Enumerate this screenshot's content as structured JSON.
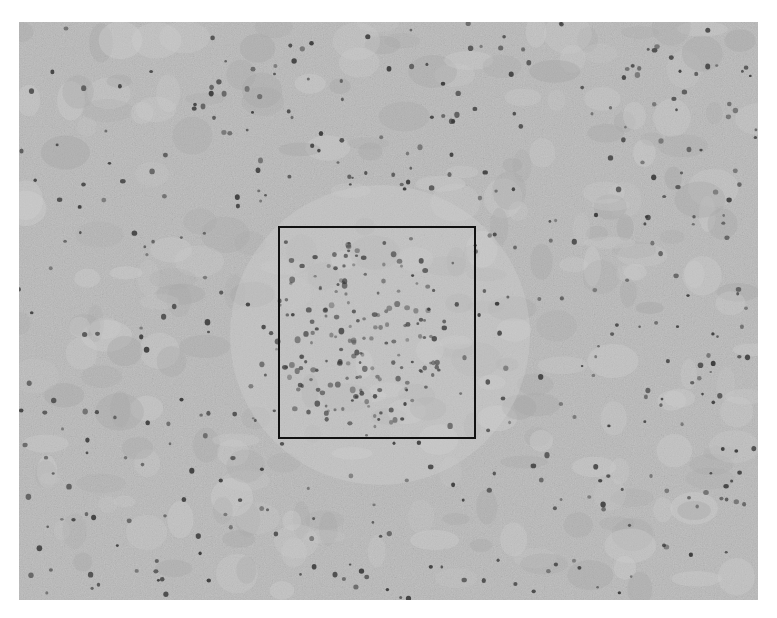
{
  "image": {
    "kind": "grayscale tissue micrograph",
    "background_color": "#b9b9b9",
    "light_patch_color": "#cfcfcf",
    "dark_patch_color": "#a6a6a6",
    "nucleus_color": "#3a3a3a",
    "frame": {
      "x": 19,
      "y": 22,
      "width": 739,
      "height": 578
    }
  },
  "region_of_interest": {
    "label": "",
    "border_color": "#111111",
    "border_width": 2,
    "x": 278,
    "y": 226,
    "width": 198,
    "height": 213,
    "description": "dense cluster of cells (cellular focus)"
  },
  "nuclei": {
    "scattered_count": 420,
    "cluster_count": 160,
    "cluster_center": {
      "x": 360,
      "y": 335
    },
    "cluster_radius": 80
  }
}
